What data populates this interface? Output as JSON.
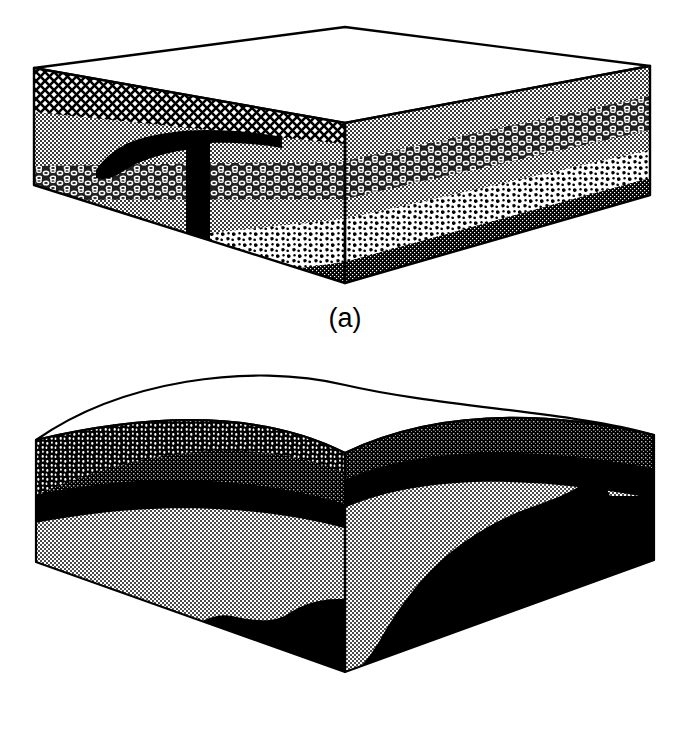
{
  "figure": {
    "background_color": "#ffffff",
    "ink_color": "#000000",
    "panels": [
      {
        "id": "a",
        "caption": "(a)",
        "description": "Rectangular block diagram showing flat-lying horizontal sedimentary strata cut by a dark igneous intrusion (dike feeding a sill / laccolith) on the left front face.",
        "block_shape": "rectangular-prism",
        "top_surface": "flat",
        "layers": [
          {
            "name": "cross-hatch-unit",
            "pattern": "cross-hatch",
            "fill": "#ffffff",
            "ink": "#000000",
            "order": 1
          },
          {
            "name": "light-stipple-unit",
            "pattern": "fine-stipple",
            "fill": "#c8c8c8",
            "ink": "#000000",
            "order": 2
          },
          {
            "name": "ring-pattern-unit",
            "pattern": "ring-conglomerate",
            "fill": "#9a9a9a",
            "ink": "#000000",
            "order": 3
          },
          {
            "name": "mid-stipple-unit",
            "pattern": "fine-stipple",
            "fill": "#c8c8c8",
            "ink": "#000000",
            "order": 4
          },
          {
            "name": "coarse-clast-unit",
            "pattern": "coarse-clast",
            "fill": "#ffffff",
            "ink": "#000000",
            "order": 5
          },
          {
            "name": "basal-dark-unit",
            "pattern": "dense-stipple",
            "fill": "#6e6e6e",
            "ink": "#000000",
            "order": 6
          }
        ],
        "intrusion": {
          "name": "igneous-intrusion",
          "fill": "#000000",
          "parts": [
            "sill",
            "feeder-dike"
          ]
        }
      },
      {
        "id": "b",
        "caption": "(b)",
        "description": "Block diagram with a convex-up (domed / anticlinal) erosion surface showing folded and faulted strata; a thick black unit rises from lower right.",
        "block_shape": "domed-prism",
        "top_surface": "convex-arched",
        "layers": [
          {
            "name": "coarse-clast-unit",
            "pattern": "coarse-clast",
            "fill": "#000000",
            "ink": "#ffffff",
            "order": 1
          },
          {
            "name": "dark-gray-unit",
            "pattern": "dense-stipple",
            "fill": "#585858",
            "ink": "#000000",
            "order": 2
          },
          {
            "name": "black-marker-bed",
            "pattern": "solid",
            "fill": "#000000",
            "ink": "#000000",
            "order": 3
          },
          {
            "name": "light-gray-unit",
            "pattern": "fine-stipple",
            "fill": "#d2d2d2",
            "ink": "#000000",
            "order": 4
          },
          {
            "name": "basal-black-unit",
            "pattern": "solid",
            "fill": "#000000",
            "ink": "#000000",
            "order": 5
          }
        ]
      }
    ]
  },
  "geometry": {
    "block_a": {
      "top_back_left": [
        34,
        68
      ],
      "top_apex": [
        345,
        27
      ],
      "top_back_right": [
        650,
        66
      ],
      "front_vertex": [
        345,
        123
      ],
      "bottom_left": [
        34,
        185
      ],
      "bottom_front": [
        345,
        283
      ],
      "bottom_right": [
        650,
        195
      ]
    },
    "block_b": {
      "left_top": [
        36,
        440
      ],
      "arch_peak": [
        345,
        385
      ],
      "right_top": [
        654,
        435
      ],
      "front_vertex": [
        345,
        453
      ],
      "bottom_left": [
        36,
        562
      ],
      "bottom_front": [
        345,
        672
      ],
      "bottom_right": [
        654,
        560
      ]
    }
  }
}
